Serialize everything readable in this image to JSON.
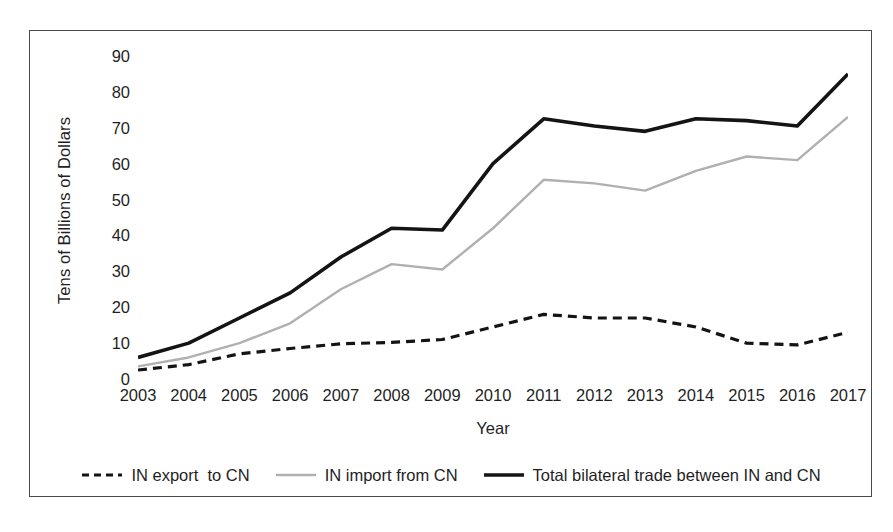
{
  "chart_data": {
    "type": "line",
    "title": "",
    "xlabel": "Year",
    "ylabel": "Tens of Billions of Dollars",
    "x": [
      2003,
      2004,
      2005,
      2006,
      2007,
      2008,
      2009,
      2010,
      2011,
      2012,
      2013,
      2014,
      2015,
      2016,
      2017
    ],
    "categories": [
      "2003",
      "2004",
      "2005",
      "2006",
      "2007",
      "2008",
      "2009",
      "2010",
      "2011",
      "2012",
      "2013",
      "2014",
      "2015",
      "2016",
      "2017"
    ],
    "xlim": [
      2003,
      2017
    ],
    "ylim": [
      0,
      90
    ],
    "yticks": [
      0,
      10,
      20,
      30,
      40,
      50,
      60,
      70,
      80,
      90
    ],
    "grid": false,
    "legend_position": "bottom",
    "series": [
      {
        "name": "IN export  to CN",
        "style": "dashed",
        "color": "#141414",
        "width": 3.2,
        "values": [
          2.5,
          4.0,
          7.0,
          8.5,
          9.8,
          10.2,
          11.0,
          14.5,
          18.0,
          17.0,
          17.0,
          14.5,
          10.0,
          9.5,
          13.0
        ]
      },
      {
        "name": "IN import from CN",
        "style": "solid",
        "color": "#b0b0b0",
        "width": 2.4,
        "values": [
          3.5,
          6.0,
          10.0,
          15.5,
          25.0,
          32.0,
          30.5,
          42.0,
          55.5,
          54.5,
          52.5,
          58.0,
          62.0,
          61.0,
          73.0
        ]
      },
      {
        "name": "Total bilateral trade between IN and CN",
        "style": "solid",
        "color": "#141414",
        "width": 3.6,
        "values": [
          6.0,
          10.0,
          17.0,
          24.0,
          34.0,
          42.0,
          41.5,
          60.0,
          72.5,
          70.5,
          69.0,
          72.5,
          72.0,
          70.5,
          85.0
        ]
      }
    ]
  },
  "figure": {
    "legend": [
      {
        "label": "IN export  to CN",
        "swatch": "dashed-line-swatch"
      },
      {
        "label": "IN import from CN",
        "swatch": "gray-line-swatch"
      },
      {
        "label": "Total bilateral trade between IN and CN",
        "swatch": "black-line-swatch"
      }
    ]
  }
}
